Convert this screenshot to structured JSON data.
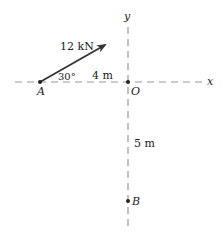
{
  "diagram": {
    "force_label": "12 kN",
    "angle_label": "30°",
    "dist_horizontal_label": "4 m",
    "dist_vertical_label": "5 m",
    "points": {
      "A": "A",
      "O": "O",
      "B": "B"
    },
    "axes": {
      "x": "x",
      "y": "y"
    },
    "colors": {
      "axis": "#999999",
      "arrow": "#333333",
      "text": "#222222"
    }
  }
}
